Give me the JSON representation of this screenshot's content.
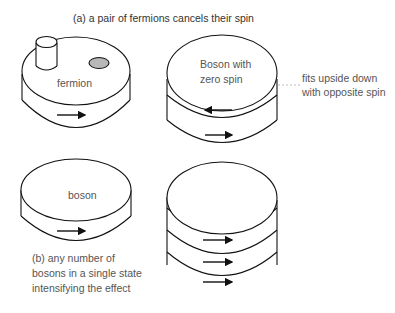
{
  "diagram": {
    "title_a": "(a)  a pair of fermions cancels their spin",
    "fermion_label": "fermion",
    "boson_zero_label_line1": "Boson with",
    "boson_zero_label_line2": "zero spin",
    "side_note_line1": "fits upside down",
    "side_note_line2": "with opposite spin",
    "boson_label": "boson",
    "caption_b_line1": "(b) any number of",
    "caption_b_line2": "bosons in a single state",
    "caption_b_line3": "intensifying the effect",
    "arrows": {
      "fermion": [
        "right"
      ],
      "boson_zero_spin": [
        "left",
        "right"
      ],
      "boson": [
        "right"
      ],
      "boson_stack": [
        "right",
        "right",
        "right"
      ]
    },
    "colors": {
      "stroke": "#111111",
      "dot_fill": "#b8b8b8",
      "dashed_line": "#aaaaaa"
    }
  }
}
